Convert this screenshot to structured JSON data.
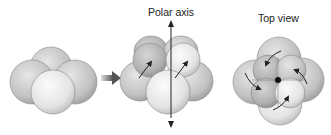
{
  "diagram": {
    "panels": [
      {
        "id": "tetrad",
        "description": "four spheres clustered"
      },
      {
        "id": "side-view",
        "label": "Polar axis",
        "description": "two spheres rotated with arrows around polar axis"
      },
      {
        "id": "top-view",
        "label": "Top view",
        "description": "four spheres twisted around central axis, curved rotation arrows"
      }
    ],
    "labels": {
      "polar_axis": "Polar axis",
      "top_view": "Top view"
    },
    "colors": {
      "sphere_light": "#eeeeee",
      "sphere_mid": "#c8c8c8",
      "sphere_dark": "#a8a8a8",
      "arrow": "#222222",
      "transition_arrow": "#555555",
      "background": "#ffffff"
    }
  }
}
